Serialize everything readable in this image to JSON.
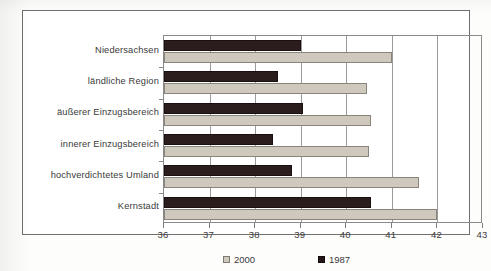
{
  "chart_data": {
    "type": "bar",
    "orientation": "horizontal",
    "title": "",
    "xlabel": "",
    "ylabel": "",
    "xlim": [
      36,
      43
    ],
    "xticks": [
      "36",
      "37",
      "38",
      "39",
      "40",
      "41",
      "42",
      "43"
    ],
    "grid": true,
    "legend_position": "bottom",
    "categories": [
      "Niedersachsen",
      "ländliche Region",
      "äußerer Einzugsbereich",
      "innerer Einzugsbereich",
      "hochverdichtetes Umland",
      "Kernstadt"
    ],
    "series": [
      {
        "name": "2000",
        "color": "#cfc8bd",
        "values": [
          41.0,
          40.45,
          40.55,
          40.5,
          41.6,
          42.0
        ]
      },
      {
        "name": "1987",
        "color": "#221616",
        "values": [
          39.0,
          38.5,
          39.05,
          38.4,
          38.8,
          40.55
        ]
      }
    ]
  },
  "legend": {
    "items": [
      {
        "label": "2000",
        "swatch": "legend-swatch-2000"
      },
      {
        "label": "1987",
        "swatch": "legend-swatch-1987"
      }
    ]
  }
}
